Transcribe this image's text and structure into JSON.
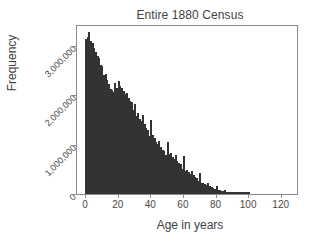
{
  "chart_data": {
    "type": "bar",
    "title": "Entire 1880 Census",
    "xlabel": "Age in years",
    "ylabel": "Frequency",
    "xlim": [
      -5,
      130
    ],
    "ylim": [
      0,
      3400000
    ],
    "grid": false,
    "legend": null,
    "bar_color": "#6f6f6f",
    "bar_edge_color": "#333333",
    "bin_width": 1,
    "xticks": [
      0,
      20,
      40,
      60,
      80,
      100,
      120
    ],
    "xtick_labels": [
      "0",
      "20",
      "40",
      "60",
      "80",
      "100",
      "120"
    ],
    "yticks": [
      0,
      1000000,
      2000000,
      3000000
    ],
    "ytick_labels": [
      "0",
      "1,000,000",
      "2,000,000",
      "3,000,000"
    ],
    "x": [
      0,
      1,
      2,
      3,
      4,
      5,
      6,
      7,
      8,
      9,
      10,
      11,
      12,
      13,
      14,
      15,
      16,
      17,
      18,
      19,
      20,
      21,
      22,
      23,
      24,
      25,
      26,
      27,
      28,
      29,
      30,
      31,
      32,
      33,
      34,
      35,
      36,
      37,
      38,
      39,
      40,
      41,
      42,
      43,
      44,
      45,
      46,
      47,
      48,
      49,
      50,
      51,
      52,
      53,
      54,
      55,
      56,
      57,
      58,
      59,
      60,
      61,
      62,
      63,
      64,
      65,
      66,
      67,
      68,
      69,
      70,
      71,
      72,
      73,
      74,
      75,
      76,
      77,
      78,
      79,
      80,
      81,
      82,
      83,
      84,
      85,
      86,
      87,
      88,
      89,
      90,
      91,
      92,
      93,
      94,
      95,
      96,
      97,
      98,
      99,
      100
    ],
    "values": [
      3140000,
      3180000,
      3280000,
      3090000,
      3050000,
      2960000,
      2880000,
      2800000,
      2750000,
      2620000,
      2600000,
      2400000,
      2420000,
      2300000,
      2220000,
      2120000,
      2100000,
      2060000,
      2250000,
      2150000,
      2290000,
      2180000,
      2150000,
      2080000,
      2020000,
      2040000,
      1940000,
      1880000,
      1860000,
      1700000,
      1830000,
      1580000,
      1640000,
      1520000,
      1470000,
      1600000,
      1420000,
      1330000,
      1300000,
      1170000,
      1500000,
      1200000,
      1130000,
      1060000,
      1010000,
      1080000,
      960000,
      900000,
      880000,
      790000,
      1060000,
      800000,
      820000,
      740000,
      700000,
      780000,
      660000,
      620000,
      600000,
      500000,
      760000,
      470000,
      480000,
      440000,
      400000,
      470000,
      380000,
      340000,
      330000,
      260000,
      420000,
      230000,
      230000,
      200000,
      180000,
      220000,
      160000,
      140000,
      130000,
      100000,
      170000,
      80000,
      80000,
      65000,
      55000,
      75000,
      45000,
      35000,
      30000,
      20000,
      35000,
      12000,
      10000,
      8000,
      6000,
      9000,
      4000,
      3000,
      2500,
      1800,
      2500
    ]
  },
  "axes": {
    "title_text": "Entire 1880 Census",
    "x_title": "Age in years",
    "y_title": "Frequency"
  }
}
